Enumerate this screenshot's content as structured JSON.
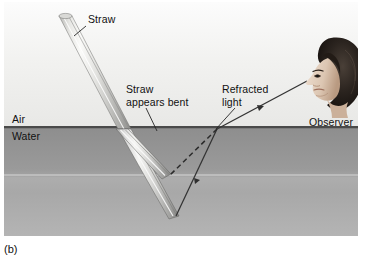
{
  "figure": {
    "caption": "(b)",
    "labels": {
      "air": "Air",
      "water": "Water",
      "straw": "Straw",
      "straw_appears_bent": "Straw appears bent",
      "refracted_light": "Refracted light",
      "observer": "Observer"
    },
    "colors": {
      "air_fill": "#f2f2f0",
      "water_fill": "#a0a0a0",
      "surface_line": "#4a4a4a",
      "ray_line": "#3a3a3a",
      "straw_light": "#f4f4f2",
      "straw_shadow": "#9c9c9a",
      "text": "#111111"
    },
    "elements": {
      "straw_in_air": "straw-above-water",
      "straw_real_submerged": "straw-real-underwater",
      "straw_apparent_submerged": "straw-apparent-underwater",
      "refracted_ray": "solid-ray-from-straw-tip-to-observer",
      "apparent_ray": "dashed-ray-backward-extension",
      "observer_head": "photo-of-observer-head-profile"
    }
  }
}
